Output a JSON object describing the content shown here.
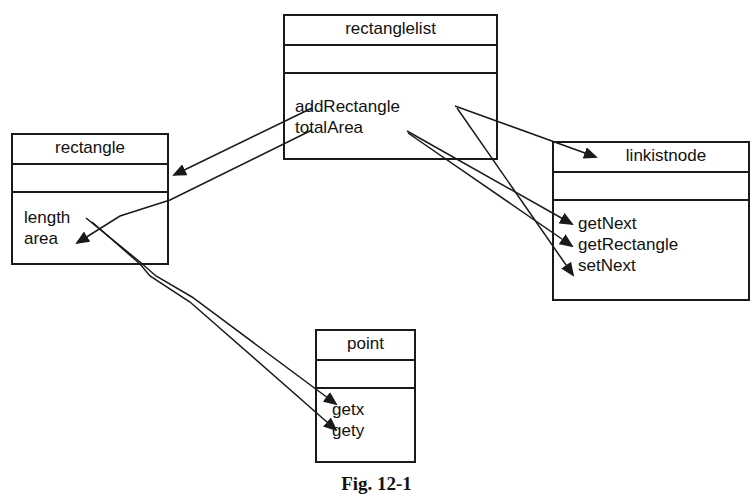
{
  "figure": {
    "caption": "Fig. 12-1"
  },
  "classes": {
    "rectanglelist": {
      "name": "rectanglelist",
      "attributes": [],
      "operations": [
        "addRectangle",
        "totalArea"
      ]
    },
    "rectangle": {
      "name": "rectangle",
      "attributes": [],
      "operations": [
        "length",
        "area"
      ]
    },
    "linkistnode": {
      "name": "linkistnode",
      "attributes": [],
      "operations": [
        "getNext",
        "getRectangle",
        "setNext"
      ]
    },
    "point": {
      "name": "point",
      "attributes": [],
      "operations": [
        "getx",
        "gety"
      ]
    }
  },
  "relationships": [
    {
      "from": "rectanglelist.addRectangle",
      "to": "rectangle"
    },
    {
      "from": "rectanglelist.totalArea",
      "to": "rectangle.area"
    },
    {
      "from": "rectanglelist.addRectangle",
      "to": "linkistnode"
    },
    {
      "from": "rectanglelist.addRectangle",
      "to": "linkistnode.setNext"
    },
    {
      "from": "rectanglelist.totalArea",
      "to": "linkistnode.getNext"
    },
    {
      "from": "rectanglelist.totalArea",
      "to": "linkistnode.getRectangle"
    },
    {
      "from": "rectangle.length",
      "to": "point.getx"
    },
    {
      "from": "rectangle.length",
      "to": "point.gety"
    }
  ],
  "colors": {
    "line": "#1a1a1a",
    "background": "#ffffff"
  }
}
